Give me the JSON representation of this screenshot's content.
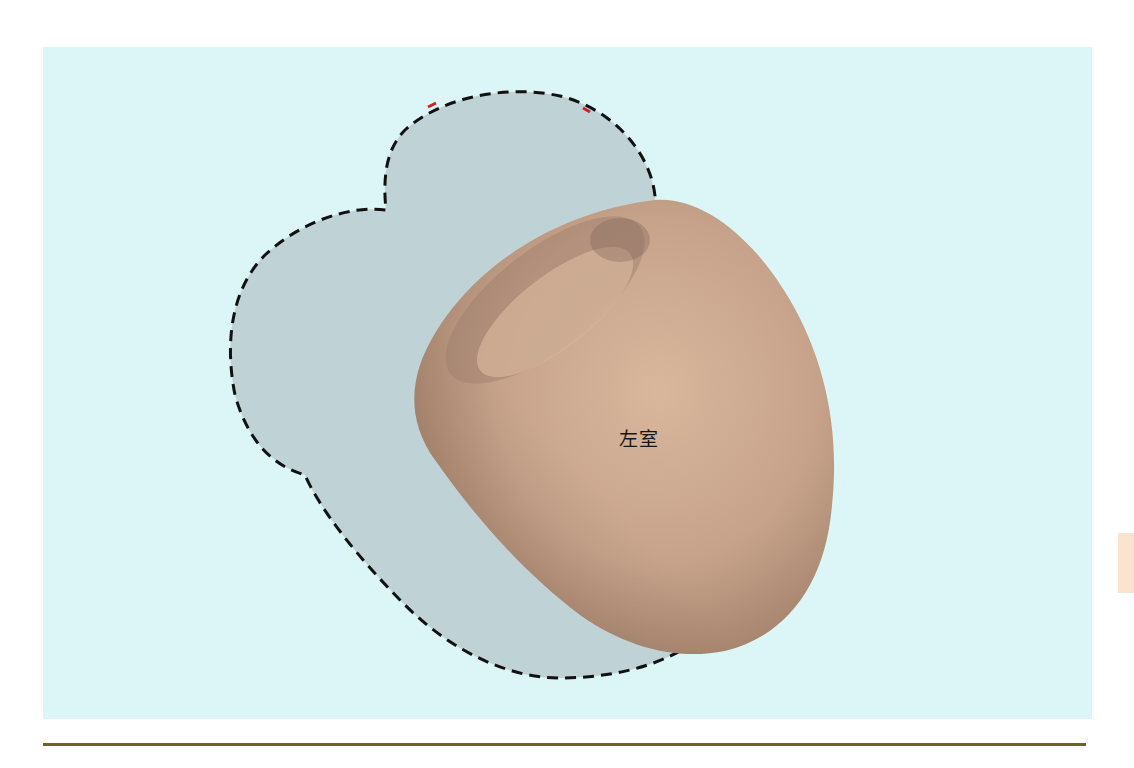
{
  "figure": {
    "background_color": "#dcf6f7",
    "heart_outline": {
      "style": "dashed",
      "stroke_color": "#111111",
      "fill_color": "#bfd3d6",
      "accent_marks_color": "#d32020"
    },
    "left_ventricle": {
      "label": "左室",
      "fill_color": "#c8a58c",
      "shadow_color": "#8a6f5e",
      "highlight_color": "#dcbca2"
    }
  },
  "page": {
    "tab_color": "#fbe3cf",
    "rule_color": "#6e6417"
  }
}
